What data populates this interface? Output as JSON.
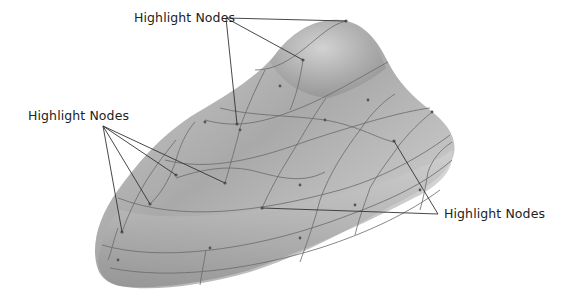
{
  "figure": {
    "surface_color": "#b9b9b9",
    "curve_color": "#6a6a6a",
    "leader_color": "#333333",
    "callouts": [
      {
        "label": "Highlight Nodes",
        "position": "top",
        "label_xy": [
          134,
          11
        ],
        "anchor": [
          226,
          18
        ],
        "targets": [
          [
            346,
            21
          ],
          [
            303,
            60
          ],
          [
            237,
            124
          ]
        ]
      },
      {
        "label": "Highlight Nodes",
        "position": "left",
        "label_xy": [
          28,
          109
        ],
        "anchor": [
          103,
          126
        ],
        "targets": [
          [
            225,
            183
          ],
          [
            176,
            175
          ],
          [
            150,
            204
          ],
          [
            122,
            232
          ]
        ]
      },
      {
        "label": "Highlight Nodes",
        "position": "right",
        "label_xy": [
          444,
          207
        ],
        "anchor": [
          438,
          214
        ],
        "targets": [
          [
            394,
            141
          ],
          [
            262,
            208
          ]
        ]
      }
    ]
  }
}
